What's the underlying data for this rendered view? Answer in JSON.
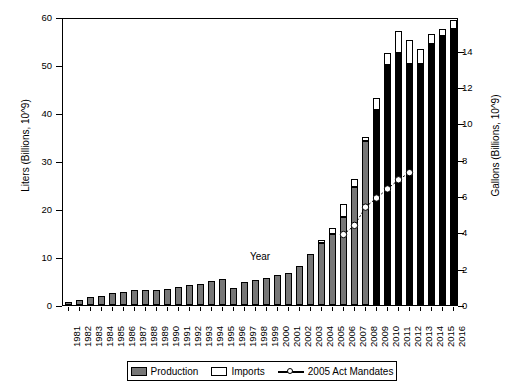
{
  "chart_data": {
    "type": "bar",
    "title": "",
    "xlabel": "Year",
    "ylabel": "Liters (Billions, 10^9)",
    "ylabel_right": "Gallons (Billions, 10^9)",
    "grid": false,
    "legend_position": "bottom",
    "ylim": [
      0,
      60
    ],
    "yticks": [
      0,
      10,
      20,
      30,
      40,
      50,
      60
    ],
    "ylim_right": [
      0,
      15.85
    ],
    "yticks_right": [
      0,
      2,
      4,
      6,
      8,
      10,
      12,
      14
    ],
    "categories": [
      "1981",
      "1982",
      "1983",
      "1984",
      "1985",
      "1986",
      "1987",
      "1988",
      "1989",
      "1990",
      "1991",
      "1992",
      "1993",
      "1994",
      "1995",
      "1996",
      "1997",
      "1998",
      "1999",
      "2000",
      "2001",
      "2002",
      "2003",
      "2004",
      "2005",
      "2006",
      "2007",
      "2008",
      "2009",
      "2010",
      "2011",
      "2012",
      "2013",
      "2014",
      "2015",
      "2016"
    ],
    "series": [
      {
        "name": "Production",
        "values": [
          0.6,
          1.0,
          1.6,
          1.9,
          2.5,
          2.8,
          3.2,
          3.2,
          3.2,
          3.4,
          3.8,
          4.1,
          4.4,
          5.0,
          5.4,
          3.6,
          4.8,
          5.3,
          5.6,
          6.2,
          6.7,
          8.1,
          10.6,
          12.9,
          14.8,
          18.4,
          24.6,
          34.1,
          40.7,
          50.1,
          52.6,
          50.3,
          50.3,
          54.3,
          56.1,
          57.5
        ]
      },
      {
        "name": "Imports",
        "values": [
          0,
          0,
          0,
          0,
          0,
          0,
          0,
          0,
          0,
          0,
          0,
          0,
          0,
          0,
          0,
          0,
          0,
          0,
          0,
          0,
          0,
          0,
          0,
          0.6,
          1.3,
          2.6,
          1.7,
          0.9,
          2.4,
          2.5,
          4.4,
          5.0,
          3.0,
          2.1,
          1.5,
          1.8
        ]
      }
    ],
    "line_series": {
      "name": "2005 Act Mandates",
      "x": [
        "2006",
        "2007",
        "2008",
        "2009",
        "2010",
        "2011",
        "2012"
      ],
      "values_liters": [
        15.1,
        17.0,
        20.8,
        22.7,
        24.6,
        26.5,
        28.0
      ],
      "values_gallons": [
        4.0,
        4.5,
        5.5,
        6.0,
        6.5,
        7.0,
        7.4
      ]
    },
    "legend": [
      "Production",
      "Imports",
      "2005 Act Mandates"
    ]
  },
  "axes": {
    "left_label": "Liters (Billions, 10^9)",
    "right_label": "Gallons (Billions, 10^9)",
    "x_title": "Year",
    "left_ticks": [
      "0",
      "10",
      "20",
      "30",
      "40",
      "50",
      "60"
    ],
    "right_ticks": [
      "0",
      "2",
      "4",
      "6",
      "8",
      "10",
      "12",
      "14"
    ],
    "x_ticks": [
      "1981",
      "1982",
      "1983",
      "1984",
      "1985",
      "1986",
      "1987",
      "1988",
      "1989",
      "1990",
      "1991",
      "1992",
      "1993",
      "1994",
      "1995",
      "1996",
      "1997",
      "1998",
      "1999",
      "2000",
      "2001",
      "2002",
      "2003",
      "2004",
      "2005",
      "2006",
      "2007",
      "2008",
      "2009",
      "2010",
      "2011",
      "2012",
      "2013",
      "2014",
      "2015",
      "2016"
    ]
  },
  "legend": {
    "items": [
      {
        "label": "Production",
        "kind": "swatch-gray"
      },
      {
        "label": "Imports",
        "kind": "swatch-white"
      },
      {
        "label": "2005 Act Mandates",
        "kind": "line-marker"
      }
    ]
  },
  "colors": {
    "production": "#777777",
    "production_late": "#000000",
    "imports": "#ffffff",
    "axis": "#000000",
    "background": "#ffffff"
  }
}
